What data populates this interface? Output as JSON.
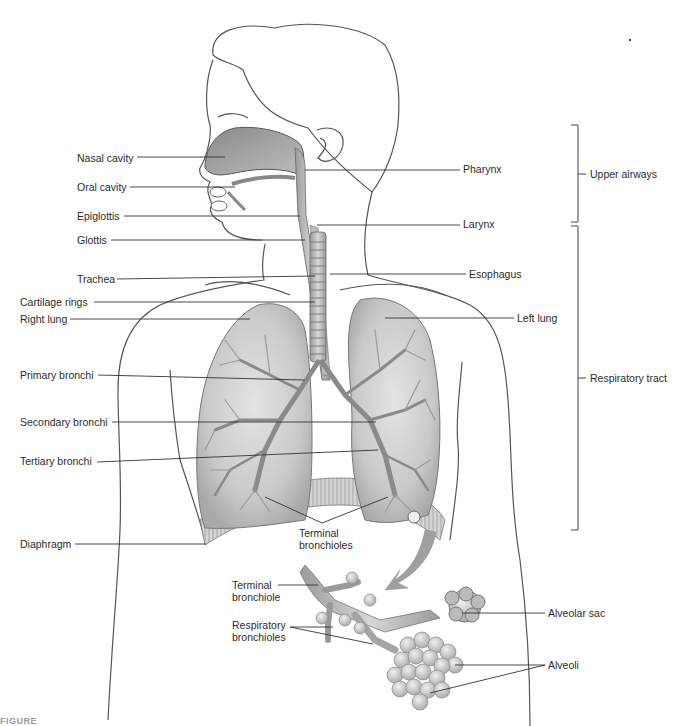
{
  "diagram": {
    "left_labels": [
      {
        "id": "nasal-cavity",
        "text": "Nasal cavity",
        "x": 77,
        "y": 152
      },
      {
        "id": "oral-cavity",
        "text": "Oral cavity",
        "x": 77,
        "y": 181
      },
      {
        "id": "epiglottis",
        "text": "Epiglottis",
        "x": 77,
        "y": 210
      },
      {
        "id": "glottis",
        "text": "Glottis",
        "x": 77,
        "y": 234
      },
      {
        "id": "trachea",
        "text": "Trachea",
        "x": 77,
        "y": 273
      },
      {
        "id": "cartilage-rings",
        "text": "Cartilage rings",
        "x": 20,
        "y": 296
      },
      {
        "id": "right-lung",
        "text": "Right lung",
        "x": 20,
        "y": 313
      },
      {
        "id": "primary-bronchi",
        "text": "Primary bronchi",
        "x": 20,
        "y": 369
      },
      {
        "id": "secondary-bronchi",
        "text": "Secondary bronchi",
        "x": 20,
        "y": 416
      },
      {
        "id": "tertiary-bronchi",
        "text": "Tertiary bronchi",
        "x": 20,
        "y": 455
      },
      {
        "id": "diaphragm",
        "text": "Diaphragm",
        "x": 20,
        "y": 538
      }
    ],
    "right_labels": [
      {
        "id": "pharynx",
        "text": "Pharynx",
        "x": 463,
        "y": 163
      },
      {
        "id": "larynx",
        "text": "Larynx",
        "x": 463,
        "y": 218
      },
      {
        "id": "esophagus",
        "text": "Esophagus",
        "x": 469,
        "y": 268
      },
      {
        "id": "left-lung",
        "text": "Left lung",
        "x": 517,
        "y": 313
      }
    ],
    "group_labels": [
      {
        "id": "upper-airways",
        "text": "Upper airways",
        "x": 590,
        "y": 169
      },
      {
        "id": "respiratory-tract",
        "text": "Respiratory tract",
        "x": 590,
        "y": 373
      }
    ],
    "detail_labels": [
      {
        "id": "terminal-bronchioles",
        "text": "Terminal bronchioles",
        "x": 299,
        "y": 527
      },
      {
        "id": "terminal-bronchiole",
        "text": "Terminal bronchiole",
        "x": 232,
        "y": 582
      },
      {
        "id": "respiratory-bronchioles",
        "text": "Respiratory bronchioles",
        "x": 232,
        "y": 622
      },
      {
        "id": "alveolar-sac",
        "text": "Alveolar sac",
        "x": 548,
        "y": 607
      },
      {
        "id": "alveoli",
        "text": "Alveoli",
        "x": 548,
        "y": 659
      }
    ],
    "caption_fragment": "FIGURE"
  }
}
